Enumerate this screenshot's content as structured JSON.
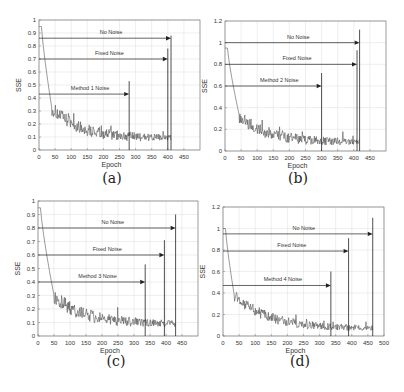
{
  "chart_data": [
    {
      "id": "a",
      "type": "line",
      "caption": "(a)",
      "xlabel": "Epoch",
      "ylabel": "SSE",
      "xlim": [
        0,
        500
      ],
      "ylim": [
        0,
        1
      ],
      "xticks": [
        0,
        50,
        100,
        150,
        200,
        250,
        300,
        350,
        400,
        450
      ],
      "yticks": [
        0,
        0.1,
        0.2,
        0.3,
        0.4,
        0.5,
        0.6,
        0.7,
        0.8,
        0.9,
        1
      ],
      "grid": true,
      "series": [
        {
          "name": "SSE",
          "start": 0.95,
          "knee_epoch": 40,
          "knee_value": 0.32,
          "end": 0.09,
          "end_epoch": 410,
          "noise": 0.04
        }
      ],
      "annotations": [
        {
          "label": "No Noise",
          "y": 0.86,
          "x_end": 410,
          "vline_top": 0.88
        },
        {
          "label": "Fixed Noise",
          "y": 0.7,
          "x_end": 400,
          "vline_top": 0.78
        },
        {
          "label": "Method 1 Noise",
          "y": 0.43,
          "x_end": 280,
          "vline_top": 0.53
        }
      ],
      "layout": {
        "left": 39,
        "top": 20,
        "right": 200,
        "bottom": 150
      }
    },
    {
      "id": "b",
      "type": "line",
      "caption": "(b)",
      "xlabel": "Epoch",
      "ylabel": "SSE",
      "xlim": [
        0,
        500
      ],
      "ylim": [
        0,
        1.2
      ],
      "xticks": [
        0,
        50,
        100,
        150,
        200,
        250,
        300,
        350,
        400,
        450
      ],
      "yticks": [
        0,
        0.2,
        0.4,
        0.6,
        0.8,
        1,
        1.2
      ],
      "grid": true,
      "series": [
        {
          "name": "SSE",
          "start": 0.95,
          "knee_epoch": 45,
          "knee_value": 0.32,
          "end": 0.08,
          "end_epoch": 418,
          "noise": 0.045
        }
      ],
      "annotations": [
        {
          "label": "No Noise",
          "y": 1.0,
          "x_end": 418,
          "vline_top": 1.12
        },
        {
          "label": "Fixed Noise",
          "y": 0.8,
          "x_end": 410,
          "vline_top": 0.93
        },
        {
          "label": "Method 2 Noise",
          "y": 0.6,
          "x_end": 300,
          "vline_top": 0.72
        }
      ],
      "layout": {
        "left": 225,
        "top": 21,
        "right": 386,
        "bottom": 151
      }
    },
    {
      "id": "c",
      "type": "line",
      "caption": "(c)",
      "xlabel": "Epoch",
      "ylabel": "SSE",
      "xlim": [
        0,
        500
      ],
      "ylim": [
        0,
        1
      ],
      "xticks": [
        0,
        50,
        100,
        150,
        200,
        250,
        300,
        350,
        400,
        450
      ],
      "yticks": [
        0,
        0.1,
        0.2,
        0.3,
        0.4,
        0.5,
        0.6,
        0.7,
        0.8,
        0.9,
        1
      ],
      "grid": true,
      "series": [
        {
          "name": "SSE",
          "start": 0.95,
          "knee_epoch": 50,
          "knee_value": 0.3,
          "end": 0.09,
          "end_epoch": 430,
          "noise": 0.04
        }
      ],
      "annotations": [
        {
          "label": "No Noise",
          "y": 0.8,
          "x_end": 430,
          "vline_top": 0.9
        },
        {
          "label": "Fixed Noise",
          "y": 0.6,
          "x_end": 395,
          "vline_top": 0.71
        },
        {
          "label": "Method 3 Noise",
          "y": 0.4,
          "x_end": 335,
          "vline_top": 0.53
        }
      ],
      "layout": {
        "left": 38,
        "top": 201,
        "right": 198,
        "bottom": 336
      }
    },
    {
      "id": "d",
      "type": "line",
      "caption": "(d)",
      "xlabel": "Epoch",
      "ylabel": "SSE",
      "xlim": [
        0,
        500
      ],
      "ylim": [
        0,
        1.2
      ],
      "xticks": [
        0,
        50,
        100,
        150,
        200,
        250,
        300,
        350,
        400,
        450,
        500
      ],
      "yticks": [
        0,
        0.2,
        0.4,
        0.6,
        0.8,
        1,
        1.2
      ],
      "grid": true,
      "series": [
        {
          "name": "SSE",
          "start": 1.0,
          "knee_epoch": 35,
          "knee_value": 0.38,
          "end": 0.07,
          "end_epoch": 465,
          "noise": 0.04
        }
      ],
      "annotations": [
        {
          "label": "No Noise",
          "y": 0.95,
          "x_end": 465,
          "vline_top": 1.1
        },
        {
          "label": "Fixed Noise",
          "y": 0.79,
          "x_end": 390,
          "vline_top": 0.91
        },
        {
          "label": "Method 4 Noise",
          "y": 0.47,
          "x_end": 335,
          "vline_top": 0.6
        }
      ],
      "layout": {
        "left": 223,
        "top": 207,
        "right": 384,
        "bottom": 336
      }
    }
  ],
  "captions": {
    "a": "(a)",
    "b": "(b)",
    "c": "(c)",
    "d": "(d)"
  },
  "colors": {
    "line": "#555555",
    "grid": "#e3e3e3",
    "axis": "#444444",
    "arrow": "#222222"
  }
}
